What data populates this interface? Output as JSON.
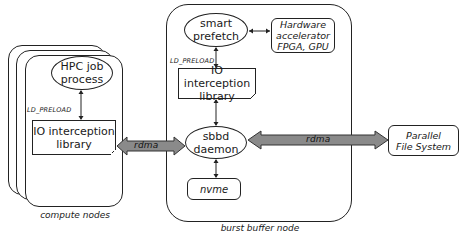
{
  "compute_nodes": {
    "caption": "compute nodes",
    "hpc_job": {
      "line1": "HPC job",
      "line2": "process"
    },
    "ld_preload_label": "LD_PRELOAD",
    "io_lib": {
      "line1": "IO interception",
      "line2": "library"
    }
  },
  "links": {
    "left_rdma": "rdma",
    "right_rdma": "rdma"
  },
  "burst_buffer": {
    "caption": "burst buffer node",
    "smart_prefetch": {
      "line1": "smart",
      "line2": "prefetch"
    },
    "hw_accel": {
      "line1": "Hardware",
      "line2": "accelerator",
      "line3": "FPGA, GPU"
    },
    "ld_preload_label": "LD_PRELOAD",
    "io_lib": {
      "line1": "IO interception",
      "line2": "library"
    },
    "sbbd": {
      "line1": "sbbd",
      "line2": "daemon"
    },
    "nvme": "nvme"
  },
  "pfs": {
    "line1": "Parallel",
    "line2": "File System"
  },
  "colors": {
    "arrow_fill": "#8a8a8a",
    "stroke": "#222222"
  }
}
